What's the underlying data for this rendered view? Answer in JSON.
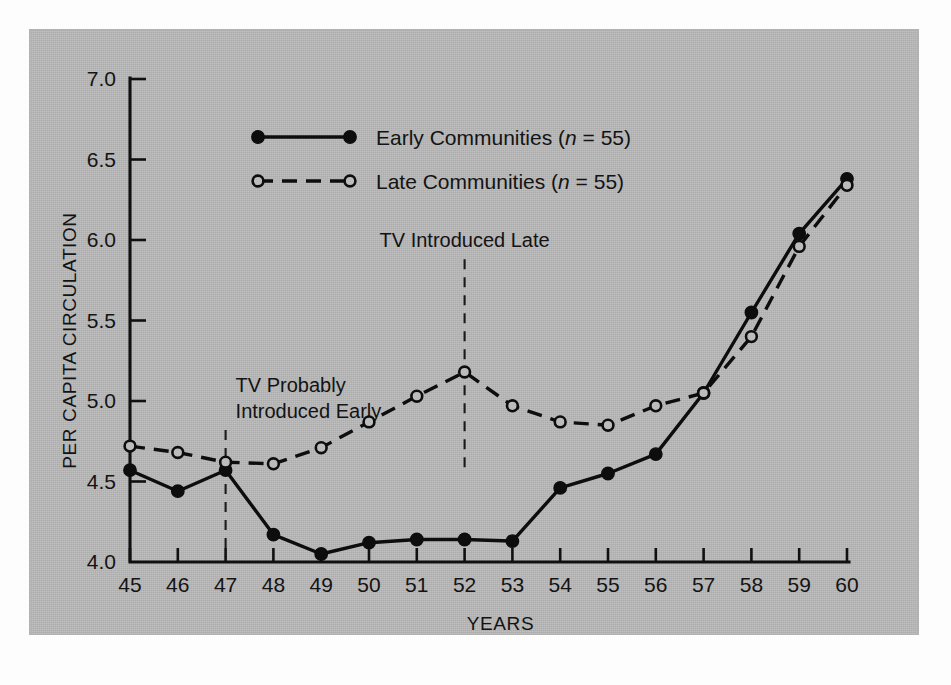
{
  "figure": {
    "panel_color": "#b9b9b9",
    "ink_color": "#0d0d0d",
    "page_color": "#ffffff"
  },
  "chart_data": {
    "type": "line",
    "title": "",
    "xlabel": "YEARS",
    "ylabel": "PER CAPITA CIRCULATION",
    "x": [
      45,
      46,
      47,
      48,
      49,
      50,
      51,
      52,
      53,
      54,
      55,
      56,
      57,
      58,
      59,
      60
    ],
    "categories": [
      "45",
      "46",
      "47",
      "48",
      "49",
      "50",
      "51",
      "52",
      "53",
      "54",
      "55",
      "56",
      "57",
      "58",
      "59",
      "60"
    ],
    "xtick_labels": [
      "45",
      "46",
      "47",
      "48",
      "49",
      "50",
      "51",
      "52",
      "53",
      "54",
      "55",
      "56",
      "57",
      "58",
      "59",
      "60"
    ],
    "ytick_labels": [
      "4.0",
      "4.5",
      "5.0",
      "5.5",
      "6.0",
      "6.5",
      "7.0"
    ],
    "yticks": [
      4.0,
      4.5,
      5.0,
      5.5,
      6.0,
      6.5,
      7.0
    ],
    "xlim": [
      45,
      60
    ],
    "ylim": [
      4.0,
      7.0
    ],
    "grid": false,
    "legend_position": "top-center",
    "series": [
      {
        "name": "Early Communities (n = 55)",
        "label_main": "Early Communities",
        "label_n": "n",
        "label_n_value": " =  55)",
        "marker": "filled-circle",
        "linestyle": "solid",
        "values": [
          4.57,
          4.44,
          4.57,
          4.17,
          4.05,
          4.12,
          4.14,
          4.14,
          4.13,
          4.46,
          4.55,
          4.67,
          5.05,
          5.55,
          6.04,
          6.38
        ]
      },
      {
        "name": "Late Communities (n = 55)",
        "label_main": "Late Communities",
        "label_n": "n",
        "label_n_value": " =  55)",
        "marker": "open-circle",
        "linestyle": "dashed",
        "values": [
          4.72,
          4.68,
          4.62,
          4.61,
          4.71,
          4.87,
          5.03,
          5.18,
          4.97,
          4.87,
          4.85,
          4.97,
          5.05,
          5.4,
          5.96,
          6.34
        ]
      }
    ],
    "annotations": [
      {
        "id": "tv-early",
        "lines": [
          "TV Probably",
          "Introduced Early"
        ],
        "x": 47,
        "rule_top": 4.82,
        "rule_bottom": 4.03
      },
      {
        "id": "tv-late",
        "lines": [
          "TV Introduced Late"
        ],
        "x": 52,
        "rule_top": 5.88,
        "rule_bottom": 4.56
      }
    ]
  },
  "legend": {
    "entries": [
      {
        "label_main": "Early Communities",
        "italic_n": "n",
        "tail": " =  55)",
        "open_paren": "(",
        "marker": "filled-circle",
        "linestyle": "solid"
      },
      {
        "label_main": "Late Communities",
        "italic_n": "n",
        "tail": " =  55)",
        "open_paren": "(",
        "marker": "open-circle",
        "linestyle": "dashed"
      }
    ]
  }
}
